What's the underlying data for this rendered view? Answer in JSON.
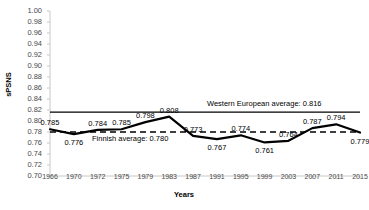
{
  "chart_data": {
    "type": "line",
    "title": "",
    "xlabel": "Years",
    "ylabel": "sPSNS",
    "ylim": [
      0.7,
      1.0
    ],
    "ytick_step": 0.02,
    "grid": false,
    "legend": "none",
    "categories": [
      "1966",
      "1970",
      "1972",
      "1975",
      "1979",
      "1983",
      "1987",
      "1991",
      "1995",
      "1999",
      "2003",
      "2007",
      "2011",
      "2015"
    ],
    "values": [
      0.785,
      0.776,
      0.784,
      0.785,
      0.798,
      0.808,
      0.773,
      0.767,
      0.774,
      0.761,
      0.764,
      0.787,
      0.794,
      0.779
    ],
    "point_labels": [
      "0.785",
      "0.776",
      "0.784",
      "0.785",
      "0.798",
      "0.808",
      "0.773",
      "0.767",
      "0.774",
      "0.761",
      "0.764",
      "0.787",
      "0.794",
      "0.779"
    ],
    "ytick_labels": [
      "1.00",
      "0.98",
      "0.96",
      "0.94",
      "0.92",
      "0.90",
      "0.88",
      "0.86",
      "0.84",
      "0.82",
      "0.80",
      "0.78",
      "0.76",
      "0.74",
      "0.72",
      "0.70"
    ],
    "reference_lines": [
      {
        "name": "western-european-average",
        "value": 0.816,
        "label": "Western European average: 0.816",
        "style": "solid",
        "color": "#000000"
      },
      {
        "name": "finnish-average",
        "value": 0.78,
        "label": "Finnish average: 0.780",
        "style": "dashed",
        "color": "#000000"
      }
    ],
    "series_color": "#000000",
    "axis_color": "#c8c8c8"
  }
}
